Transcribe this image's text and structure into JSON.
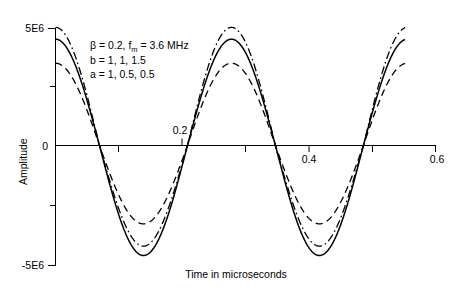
{
  "chart_data": {
    "type": "line",
    "title": "",
    "xlabel": "Time in microseconds",
    "ylabel": "Amplitude",
    "xlim": [
      0,
      0.6
    ],
    "ylim": [
      -5000000,
      5000000
    ],
    "xticks": [
      0.2,
      0.4,
      0.6
    ],
    "xtick_labels": [
      "0.2",
      "0.4",
      "0.6"
    ],
    "xminor_ticks": [
      0.1,
      0.3,
      0.5
    ],
    "yticks": [
      -5000000,
      0,
      5000000
    ],
    "ytick_labels": [
      "-5E6",
      "0",
      "5E6"
    ],
    "yminor_ticks": [
      -2500000,
      2500000
    ],
    "grid": false,
    "legend": "none",
    "x_data_range": [
      0,
      0.552
    ],
    "period_us": 0.2778,
    "phase_offset_us": 0.0,
    "series": [
      {
        "name": "a = 1, b = 1",
        "style": "solid",
        "amplitude": 4700000,
        "shape_flatten": 0.12,
        "values_at_extrema": {
          "t_0": 4480000,
          "first_min_t": 0.139,
          "first_min": -4700000,
          "first_max_t": 0.278,
          "first_max": 4650000,
          "second_min_t": 0.417,
          "second_min": -4700000,
          "t_end": 4500000
        }
      },
      {
        "name": "a = 0.5, b = 1",
        "style": "dashed",
        "amplitude": 3500000,
        "shape_flatten": 0.05,
        "values_at_extrema": {
          "t_0": 3450000,
          "first_min_t": 0.139,
          "first_min": -3350000,
          "first_max_t": 0.278,
          "first_max": 3600000,
          "second_min_t": 0.417,
          "second_min": -3350000,
          "t_end": 3500000
        }
      },
      {
        "name": "a = 0.5, b = 1.5",
        "style": "dash-dot",
        "amplitude": 5000000,
        "shape_flatten": 0.16,
        "values_at_extrema": {
          "t_0": 4950000,
          "first_min_t": 0.139,
          "first_min": -4300000,
          "first_max_t": 0.278,
          "first_max": 5150000,
          "second_min_t": 0.417,
          "second_min": -4300000,
          "t_end": 5050000
        }
      }
    ],
    "annotation_lines": [
      "β = 0.2, f_m = 3.6 MHz",
      "b = 1, 1, 1.5",
      "a = 1, 0.5, 0.5"
    ]
  },
  "annotation": {
    "line1_pre": "β = 0.2, f",
    "line1_sub": "m",
    "line1_post": " = 3.6 MHz",
    "line2": "b = 1, 1, 1.5",
    "line3": "a = 1, 0.5, 0.5"
  },
  "axes": {
    "ylabel": "Amplitude",
    "xlabel": "Time in microseconds",
    "ytick_top": "5E6",
    "ytick_zero": "0",
    "ytick_bottom": "-5E6",
    "xtick_1": "0.2",
    "xtick_2": "0.4",
    "xtick_3": "0.6"
  },
  "colors": {
    "ink": "#000000",
    "background": "#ffffff"
  }
}
